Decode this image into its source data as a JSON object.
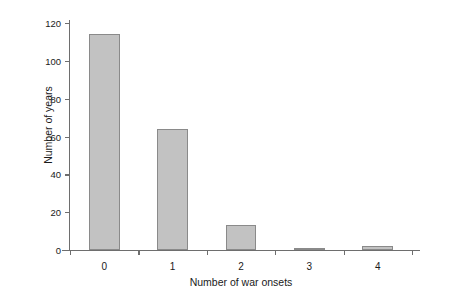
{
  "chart_data": {
    "type": "bar",
    "title": "",
    "xlabel": "Number of war onsets",
    "ylabel": "Number of years",
    "categories": [
      "0",
      "1",
      "2",
      "3",
      "4"
    ],
    "values": [
      114,
      64,
      13,
      1,
      2
    ],
    "yticks": [
      0,
      20,
      40,
      60,
      80,
      100,
      120
    ],
    "ylim": [
      0,
      120
    ],
    "grid": false,
    "legend": null,
    "bar_color": "#c2c2c2",
    "bar_edge_color": "#8a8a8a",
    "axis_color": "#6e6e6e",
    "background": "#ffffff"
  }
}
